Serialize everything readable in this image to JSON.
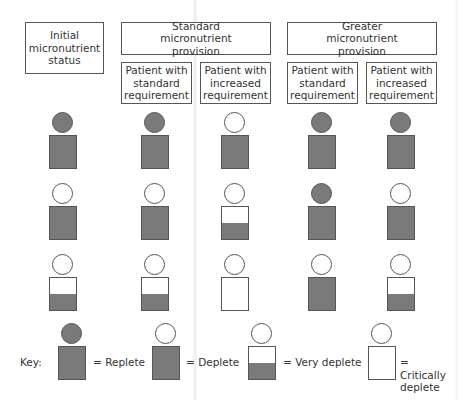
{
  "headers": {
    "initial": "Initial micronutrient status",
    "standard_group": "Standard micronutrient provision",
    "greater_group": "Greater micronutrient provision",
    "sub": [
      "Patient with standard requirement",
      "Patient with increased requirement",
      "Patient with standard requirement",
      "Patient with increased requirement"
    ]
  },
  "colors": {
    "fill": "#7a7a7a",
    "stroke": "#555555"
  },
  "grid": {
    "columns": [
      "initial",
      "standard-standard",
      "standard-increased",
      "greater-standard",
      "greater-increased"
    ],
    "rows": [
      [
        "replete",
        "replete",
        "deplete",
        "replete",
        "replete"
      ],
      [
        "deplete",
        "deplete",
        "very-deplete",
        "replete",
        "deplete"
      ],
      [
        "very-deplete",
        "very-deplete",
        "critically-deplete",
        "deplete",
        "very-deplete"
      ]
    ]
  },
  "key": {
    "label": "Key:",
    "items": [
      {
        "state": "replete",
        "text": "= Replete"
      },
      {
        "state": "deplete",
        "text": "= Deplete"
      },
      {
        "state": "very-deplete",
        "text": "= Very deplete"
      },
      {
        "state": "critically-deplete",
        "text": "= Critically deplete"
      }
    ]
  }
}
